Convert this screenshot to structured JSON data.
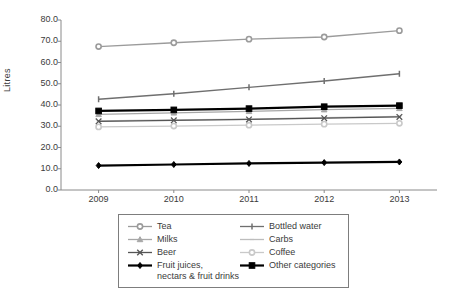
{
  "chart_data": {
    "type": "line",
    "title": "",
    "xlabel": "",
    "ylabel": "Litres",
    "categories": [
      "2009",
      "2010",
      "2011",
      "2012",
      "2013"
    ],
    "ylim": [
      0.0,
      80.0
    ],
    "yticks": [
      "0.0",
      "10.0",
      "20.0",
      "30.0",
      "40.0",
      "50.0",
      "60.0",
      "70.0",
      "80.0"
    ],
    "grid": false,
    "legend_position": "bottom",
    "series": [
      {
        "name": "Tea",
        "values": [
          67.5,
          69.3,
          71.0,
          72.0,
          75.0
        ],
        "color": "#9b9b9b",
        "marker": "circle"
      },
      {
        "name": "Bottled water",
        "values": [
          42.7,
          45.3,
          48.3,
          51.3,
          54.7
        ],
        "color": "#6f6f6f",
        "marker": "dash"
      },
      {
        "name": "Milks",
        "values": [
          35.6,
          36.3,
          37.0,
          37.8,
          38.4
        ],
        "color": "#a7a7a7",
        "marker": "triangle"
      },
      {
        "name": "Carbs",
        "values": [
          32.5,
          33.0,
          33.3,
          34.0,
          34.6
        ],
        "color": "#bdbdbd",
        "marker": "line"
      },
      {
        "name": "Beer",
        "values": [
          32.3,
          32.8,
          33.2,
          33.8,
          34.4
        ],
        "color": "#555555",
        "marker": "x"
      },
      {
        "name": "Coffee",
        "values": [
          29.7,
          30.1,
          30.5,
          31.0,
          31.4
        ],
        "color": "#c9c9c9",
        "marker": "circle"
      },
      {
        "name": "Fruit juices,\nnectars & fruit drinks",
        "values": [
          11.5,
          12.0,
          12.5,
          12.9,
          13.2
        ],
        "color": "#000000",
        "marker": "diamond"
      },
      {
        "name": "Other categories",
        "values": [
          37.2,
          37.7,
          38.3,
          39.2,
          39.7
        ],
        "color": "#000000",
        "marker": "square"
      }
    ]
  },
  "legend": {
    "items": [
      {
        "label": "Tea"
      },
      {
        "label": "Bottled water"
      },
      {
        "label": "Milks"
      },
      {
        "label": "Carbs"
      },
      {
        "label": "Beer"
      },
      {
        "label": "Coffee"
      },
      {
        "label": "Fruit juices,\nnectars & fruit drinks"
      },
      {
        "label": "Other categories"
      }
    ]
  },
  "axes": {
    "y_title": "Litres"
  }
}
